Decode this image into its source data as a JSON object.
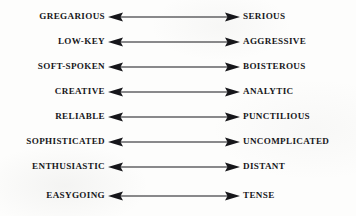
{
  "diagram": {
    "background_color": "#fdfdfc",
    "text_color": "#17171a",
    "arrow_color": "#16161a",
    "arrow_type": "double-headed",
    "pairs": [
      {
        "left": "GREGARIOUS",
        "right": "SERIOUS",
        "arrow": "double-arrow-icon"
      },
      {
        "left": "LOW-KEY",
        "right": "AGGRESSIVE",
        "arrow": "double-arrow-icon"
      },
      {
        "left": "SOFT-SPOKEN",
        "right": "BOISTEROUS",
        "arrow": "double-arrow-icon"
      },
      {
        "left": "CREATIVE",
        "right": "ANALYTIC",
        "arrow": "double-arrow-icon"
      },
      {
        "left": "RELIABLE",
        "right": "PUNCTILIOUS",
        "arrow": "double-arrow-icon"
      },
      {
        "left": "SOPHISTICATED",
        "right": "UNCOMPLICATED",
        "arrow": "double-arrow-icon"
      },
      {
        "left": "ENTHUSIASTIC",
        "right": "DISTANT",
        "arrow": "double-arrow-icon"
      },
      {
        "left": "EASYGOING",
        "right": "TENSE",
        "arrow": "double-arrow-icon"
      }
    ]
  }
}
